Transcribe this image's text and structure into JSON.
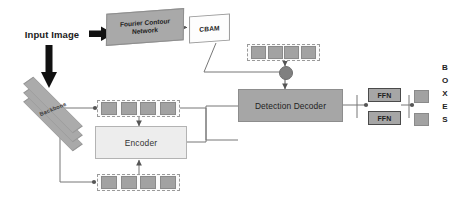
{
  "diagram": {
    "colors": {
      "gray_fill": "#a6a6a6",
      "light_fill": "#ededed",
      "white_fill": "#fdfdfd",
      "token_fill": "#a2a2a2",
      "arrow_black": "#111111",
      "line_gray": "#808080",
      "dashed_border": "#9a9a9a"
    },
    "nodes": {
      "input_image": "Input Image",
      "fourier_contour_network": "Fourier Contour\nNetwork",
      "fourier_contour_network_line1": "Fourier Contour",
      "fourier_contour_network_line2": "Network",
      "cbam": "CBAM",
      "backbone": "Backbone",
      "encoder": "Encoder",
      "detection_decoder": "Detection Decoder",
      "ffn_top": "FFN",
      "ffn_bottom": "FFN"
    },
    "token_rows": {
      "top": [
        "",
        "",
        "",
        ""
      ],
      "middle": [
        "",
        "",
        "",
        ""
      ],
      "bottom": [
        "",
        "",
        "",
        ""
      ]
    },
    "output": {
      "letters": [
        "B",
        "O",
        "X",
        "E",
        "S"
      ],
      "word": "BOXES",
      "boxes": [
        "",
        ""
      ]
    }
  }
}
